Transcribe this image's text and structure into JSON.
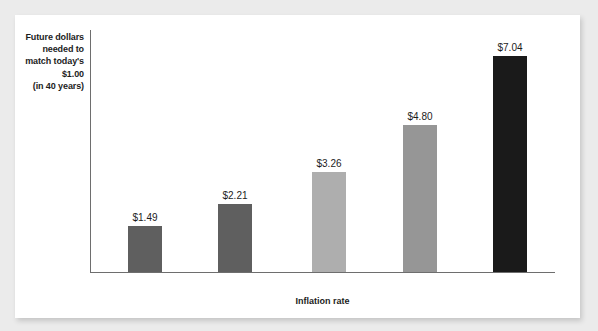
{
  "chart_data": {
    "type": "bar",
    "title": "",
    "categories": [
      "1%",
      "2%",
      "3%",
      "4%",
      "5%"
    ],
    "values": [
      1.49,
      2.21,
      3.26,
      4.8,
      7.04
    ],
    "value_labels": [
      "$1.49",
      "$2.21",
      "$3.26",
      "$4.80",
      "$7.04"
    ],
    "xlabel": "Inflation rate",
    "ylabel": "Future dollars needed to match today's $1.00 (in 40 years)",
    "ylabel_lines": [
      "Future dollars",
      "needed to",
      "match today's",
      "$1.00",
      "(in 40 years)"
    ],
    "ylim": [
      0,
      7.9
    ],
    "grid": false,
    "legend": false,
    "bar_colors": [
      "#5f5f5f",
      "#5f5f5f",
      "#aeaeae",
      "#969696",
      "#1a1a1a"
    ],
    "axis_color": "#6e6e6e",
    "card_color": "#ffffff",
    "page_background": "#ebebeb",
    "text_color": "#1c1c1c"
  }
}
